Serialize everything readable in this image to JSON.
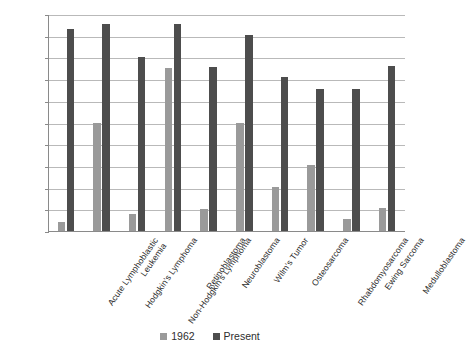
{
  "chart_data": {
    "type": "bar",
    "title": "",
    "subtitle": "",
    "xlabel": "",
    "ylabel": "",
    "ylim": [
      0,
      100
    ],
    "ytick_step": 10,
    "yticks": [
      0,
      10,
      20,
      30,
      40,
      50,
      60,
      70,
      80,
      90,
      100
    ],
    "grid": true,
    "legend_position": "bottom",
    "categories": [
      "Acute Lymphoblastic Leukemia",
      "Hodgkin's Lymphoma",
      "Non-Hodgkin's Lymphoma",
      "Retinoblastoma",
      "Neuroblastoma",
      "Wilm's Tumor",
      "Osteosarcoma",
      "Rhabdomyosarcoma",
      "Ewing Sarcoma",
      "Medulloblastoma"
    ],
    "category_lines": [
      [
        "Acute Lymphoblastic",
        "Leukemia"
      ],
      [
        "Hodgkin's Lymphoma"
      ],
      [
        "Non-Hodgkin's Lymphoma"
      ],
      [
        "Retinoblastoma"
      ],
      [
        "Neuroblastoma"
      ],
      [
        "Wilm's Tumor"
      ],
      [
        "Osteosarcoma"
      ],
      [
        "Rhabdomyosarcoma"
      ],
      [
        "Ewing Sarcoma"
      ],
      [
        "Medulloblastoma"
      ]
    ],
    "series": [
      {
        "name": "1962",
        "color": "#9a9a9a",
        "values": [
          4,
          50,
          8,
          75,
          10,
          50,
          20.5,
          30.5,
          5.5,
          10.5
        ]
      },
      {
        "name": "Present",
        "color": "#4d4d4d",
        "values": [
          93,
          95.5,
          80,
          95.5,
          75.5,
          90.5,
          71,
          65.5,
          65.5,
          76
        ]
      }
    ]
  },
  "legend": {
    "items": [
      {
        "label": "1962",
        "color": "#9a9a9a"
      },
      {
        "label": "Present",
        "color": "#4d4d4d"
      }
    ]
  },
  "axis": {
    "gridline_color": "#b9b9b9",
    "axis_color": "#8a8a8a"
  }
}
